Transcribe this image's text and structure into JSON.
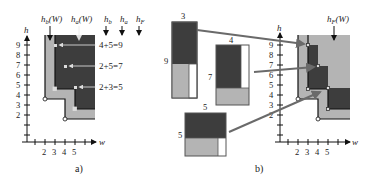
{
  "colors": {
    "dark": "#3d3d3d",
    "light": "#b4b4b4",
    "line": "#111111",
    "connector": "#6a6a6a",
    "white": "#ffffff"
  },
  "panel_a": {
    "caption": "a)",
    "axis": {
      "x_label": "w",
      "y_label": "h",
      "x_ticks": [
        "2",
        "3",
        "4",
        "5"
      ],
      "y_ticks": [
        "2",
        "3",
        "4",
        "5",
        "6",
        "7",
        "8",
        "9"
      ]
    },
    "top_labels": {
      "hb_W": "h_b(W)",
      "ha_W": "h_a(W)",
      "hb": "h_b",
      "ha": "h_a",
      "hF": "h_F"
    },
    "sums": [
      "4+5=9",
      "2+5=7",
      "2+3=5"
    ]
  },
  "panel_b": {
    "caption": "b)",
    "axis": {
      "x_label": "w",
      "y_label": "h",
      "x_ticks": [
        "2",
        "3",
        "4",
        "5"
      ],
      "y_ticks": [
        "2",
        "3",
        "4",
        "5",
        "6",
        "7",
        "8",
        "9"
      ]
    },
    "top_label": "h_F(W)",
    "blocks": [
      {
        "width_label": "3",
        "height_label": "9"
      },
      {
        "width_label": "4",
        "height_label": "7"
      },
      {
        "width_label": "5",
        "height_label": "5"
      }
    ]
  }
}
